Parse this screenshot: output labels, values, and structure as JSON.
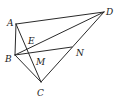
{
  "figure": {
    "type": "geometry",
    "points": [
      {
        "id": "A",
        "label": "A"
      },
      {
        "id": "B",
        "label": "B"
      },
      {
        "id": "C",
        "label": "C"
      },
      {
        "id": "D",
        "label": "D"
      },
      {
        "id": "E",
        "label": "E"
      },
      {
        "id": "M",
        "label": "M"
      },
      {
        "id": "N",
        "label": "N"
      }
    ],
    "segments": [
      [
        "A",
        "D"
      ],
      [
        "A",
        "B"
      ],
      [
        "A",
        "C"
      ],
      [
        "B",
        "D"
      ],
      [
        "B",
        "N"
      ],
      [
        "B",
        "C"
      ],
      [
        "C",
        "D"
      ]
    ],
    "relations": [
      "E lies on AC and BD",
      "M lies on AC and BN",
      "N lies on CD"
    ],
    "colors": {
      "line": "#2a2a2a",
      "label": "#1a1a1a",
      "background": "#ffffff"
    }
  }
}
